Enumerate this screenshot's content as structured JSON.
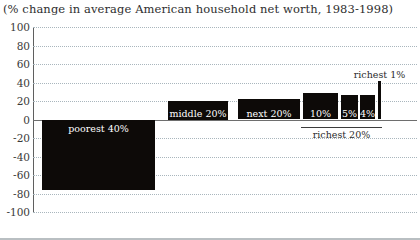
{
  "chart_data": {
    "type": "bar",
    "title": "(% change in average American household net worth, 1983-1998)",
    "xlabel": "",
    "ylabel": "",
    "ylim": [
      -100,
      100
    ],
    "yticks": [
      100,
      80,
      60,
      40,
      20,
      0,
      -20,
      -40,
      -60,
      -80,
      -100
    ],
    "ytick_labels": [
      "100",
      "80",
      "60",
      "40",
      "20",
      "0",
      "-20",
      "-40",
      "-60",
      "-80",
      "-100"
    ],
    "grid": true,
    "legend": "none",
    "categories": [
      "poorest 40%",
      "middle 20%",
      "next 20%",
      "10%",
      "5%",
      "4%",
      "richest 1%"
    ],
    "values": [
      -76,
      20,
      22,
      29,
      27,
      26,
      42
    ],
    "bar_color": "#0d0a08",
    "annotations": [
      {
        "text": "richest 20%",
        "covers": [
          "10%",
          "5%",
          "4%",
          "richest 1%"
        ]
      }
    ]
  },
  "bars": [
    {
      "label": "poorest 40%",
      "value": -76,
      "x": 42,
      "width": 113,
      "label_pos": "inside-top"
    },
    {
      "label": "middle 20%",
      "value": 20,
      "x": 168,
      "width": 60,
      "label_pos": "inside-bottom"
    },
    {
      "label": "next 20%",
      "value": 22,
      "x": 238,
      "width": 62,
      "label_pos": "inside-bottom"
    },
    {
      "label": "10%",
      "value": 29,
      "x": 303,
      "width": 35,
      "label_pos": "inside-bottom"
    },
    {
      "label": "5%",
      "value": 27,
      "x": 341,
      "width": 17,
      "label_pos": "inside-bottom"
    },
    {
      "label": "4%",
      "value": 26,
      "x": 360,
      "width": 15,
      "label_pos": "inside-bottom"
    },
    {
      "label": "richest 1%",
      "value": 42,
      "x": 378,
      "width": 3,
      "label_pos": "outside-top"
    }
  ],
  "bracket": {
    "label": "richest 20%",
    "start_x": 301,
    "end_x": 382
  }
}
